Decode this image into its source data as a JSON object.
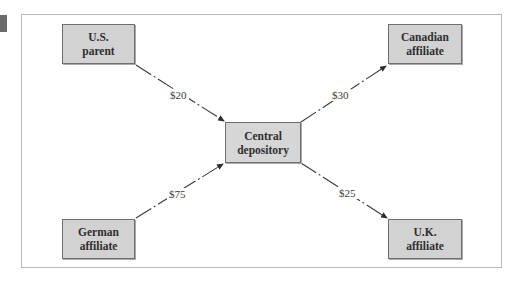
{
  "diagram": {
    "title": "",
    "nodes": {
      "us_parent": {
        "line1": "U.S.",
        "line2": "parent"
      },
      "canadian_affiliate": {
        "line1": "Canadian",
        "line2": "affiliate"
      },
      "central_depository": {
        "line1": "Central",
        "line2": "depository"
      },
      "german_affiliate": {
        "line1": "German",
        "line2": "affiliate"
      },
      "uk_affiliate": {
        "line1": "U.K.",
        "line2": "affiliate"
      }
    },
    "flows": [
      {
        "from": "U.S. parent",
        "to": "Central depository",
        "amount": "$20"
      },
      {
        "from": "Central depository",
        "to": "Canadian affiliate",
        "amount": "$30"
      },
      {
        "from": "German affiliate",
        "to": "Central depository",
        "amount": "$75"
      },
      {
        "from": "Central depository",
        "to": "U.K. affiliate",
        "amount": "$25"
      }
    ],
    "colors": {
      "box_fill": "#d2d2d2",
      "box_border": "#6e6e6e",
      "arrow": "#3a3a3a",
      "frame_border": "#b8b8b8"
    }
  }
}
